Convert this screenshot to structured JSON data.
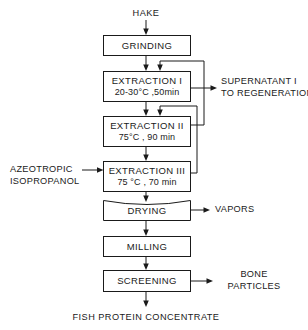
{
  "diagram": {
    "feed": {
      "label": "HAKE"
    },
    "product": {
      "label": "FISH  PROTEIN  CONCENTRATE"
    },
    "processes": [
      {
        "id": "grinding",
        "line1": "GRINDING",
        "line2": ""
      },
      {
        "id": "extraction-1",
        "line1": "EXTRACTION I",
        "line2": "20-30°C ,50min"
      },
      {
        "id": "extraction-2",
        "line1": "EXTRACTION II",
        "line2": "75°C , 90 min"
      },
      {
        "id": "extraction-3",
        "line1": "EXTRACTION III",
        "line2": "75 °C , 70 min"
      },
      {
        "id": "drying",
        "line1": "DRYING",
        "line2": ""
      },
      {
        "id": "milling",
        "line1": "MILLING",
        "line2": ""
      },
      {
        "id": "screening",
        "line1": "SCREENING",
        "line2": ""
      }
    ],
    "side_streams": [
      {
        "id": "supernatant",
        "side": "right",
        "line1": "SUPERNATANT I",
        "line2": "TO REGENERATION"
      },
      {
        "id": "azeotropic-isopropanol",
        "side": "left",
        "line1": "AZEOTROPIC",
        "line2": "ISOPROPANOL"
      },
      {
        "id": "vapors",
        "side": "right",
        "line1": "VAPORS",
        "line2": ""
      },
      {
        "id": "bone-particles",
        "side": "right",
        "line1": "BONE",
        "line2": "PARTICLES"
      }
    ],
    "colors": {
      "background": "#ffffff",
      "ink": "#1a1a1a"
    }
  }
}
